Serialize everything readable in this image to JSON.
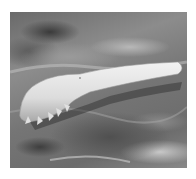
{
  "image": {
    "description": "Grayscale scanning electron micrograph of an elongated mite with short stubby legs lying on a textured skin surface",
    "alt": "SEM image of a mite on skin"
  }
}
